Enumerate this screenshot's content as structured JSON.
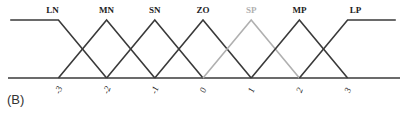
{
  "panel_label": "(B)",
  "colors": {
    "line": "#3a3a3a",
    "highlight": "#b0b0b0",
    "label": "#222222"
  },
  "chart_data": {
    "type": "line",
    "title": "",
    "xlabel": "",
    "ylabel": "",
    "x_ticks": [
      "-3",
      "-2",
      "-1",
      "0",
      "1",
      "2",
      "3"
    ],
    "ylim": [
      0,
      1
    ],
    "series": [
      {
        "name": "LN",
        "points": [
          [
            -4,
            1
          ],
          [
            -3,
            1
          ],
          [
            -2,
            0
          ]
        ],
        "highlight": false
      },
      {
        "name": "MN",
        "points": [
          [
            -3,
            0
          ],
          [
            -2,
            1
          ],
          [
            -1,
            0
          ]
        ],
        "highlight": false
      },
      {
        "name": "SN",
        "points": [
          [
            -2,
            0
          ],
          [
            -1,
            1
          ],
          [
            0,
            0
          ]
        ],
        "highlight": false
      },
      {
        "name": "ZO",
        "points": [
          [
            -1,
            0
          ],
          [
            0,
            1
          ],
          [
            1,
            0
          ]
        ],
        "highlight": false
      },
      {
        "name": "SP",
        "points": [
          [
            0,
            0
          ],
          [
            1,
            1
          ],
          [
            2,
            0
          ]
        ],
        "highlight": true
      },
      {
        "name": "MP",
        "points": [
          [
            1,
            0
          ],
          [
            2,
            1
          ],
          [
            3,
            0
          ]
        ],
        "highlight": false
      },
      {
        "name": "LP",
        "points": [
          [
            2,
            0
          ],
          [
            3,
            1
          ],
          [
            4,
            1
          ]
        ],
        "highlight": false
      }
    ]
  }
}
